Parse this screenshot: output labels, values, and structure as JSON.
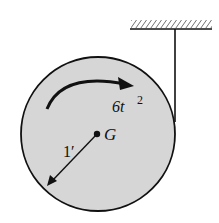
{
  "diagram": {
    "type": "disk-unwinding-from-rope",
    "labels": {
      "angular_acceleration": "6t",
      "angular_acceleration_exp": "2",
      "center": "G",
      "radius": "1′"
    },
    "colors": {
      "disk_fill": "#d6d6d6",
      "stroke": "#111111",
      "background": "#ffffff"
    },
    "geometry": {
      "disk_center": [
        98,
        134
      ],
      "disk_radius": 77,
      "ceiling_y": 29,
      "rope_x": 175
    }
  }
}
